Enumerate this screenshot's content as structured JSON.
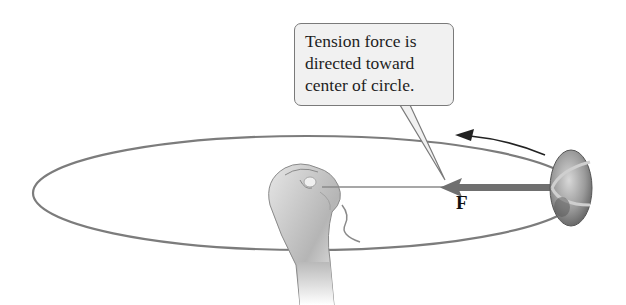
{
  "diagram": {
    "callout": {
      "lines": [
        "Tension force is",
        "directed toward",
        "center of circle."
      ]
    },
    "force_label": "F",
    "elements": {
      "path": "circular-path-ellipse",
      "hand": "hand-holding-string",
      "string": "string",
      "rock": "rock",
      "force_arrow": "tension-force-arrow",
      "motion_arrow": "counterclockwise-motion-arrow"
    },
    "colors": {
      "path": "#7a7a7a",
      "force_arrow": "#707070",
      "callout_bg": "#f1f1f1",
      "callout_border": "#7a7a7a"
    }
  }
}
